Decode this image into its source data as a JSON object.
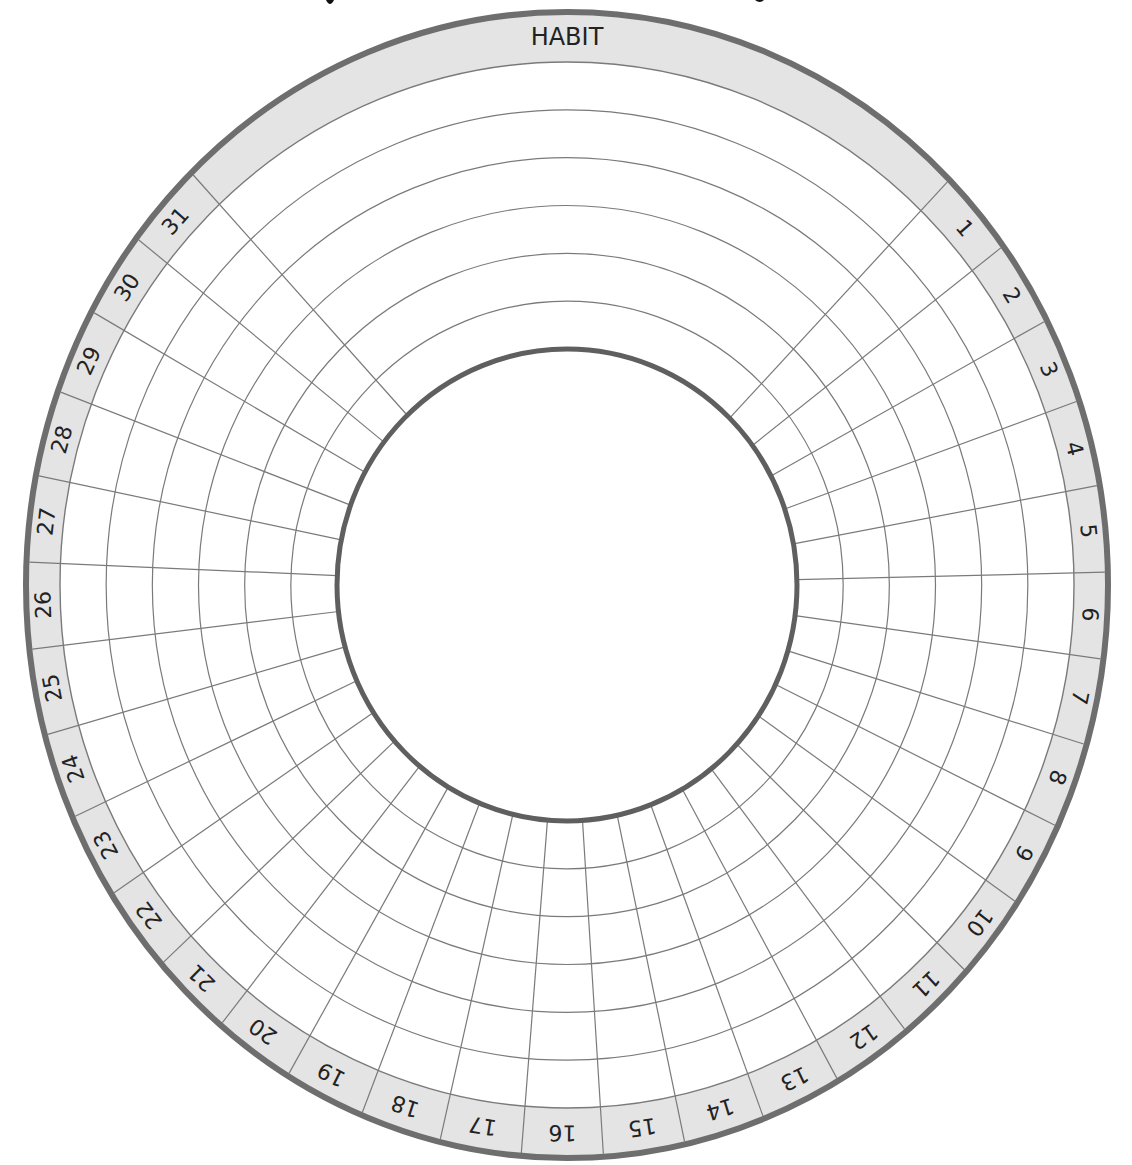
{
  "tracker": {
    "header_label": "HABIT",
    "days": [
      "1",
      "2",
      "3",
      "4",
      "5",
      "6",
      "7",
      "8",
      "9",
      "10",
      "11",
      "12",
      "13",
      "14",
      "15",
      "16",
      "17",
      "18",
      "19",
      "20",
      "21",
      "22",
      "23",
      "24",
      "25",
      "26",
      "27",
      "28",
      "29",
      "30",
      "31"
    ],
    "habit_rings": 6,
    "geometry": {
      "cx": 567,
      "cy": 585,
      "outer_rx": 541,
      "outer_ry": 573,
      "band_rx": 507,
      "band_ry": 523,
      "inner_rx": 230,
      "inner_ry": 236,
      "start_angle_deg": 45,
      "end_angle_deg": 316
    },
    "colors": {
      "band_fill": "#e4e4e4",
      "outer_stroke": "#6e6e6e",
      "inner_stroke": "#5f5f5f",
      "grid_stroke": "#7a7a7a",
      "text": "#222222",
      "background": "#ffffff"
    }
  }
}
